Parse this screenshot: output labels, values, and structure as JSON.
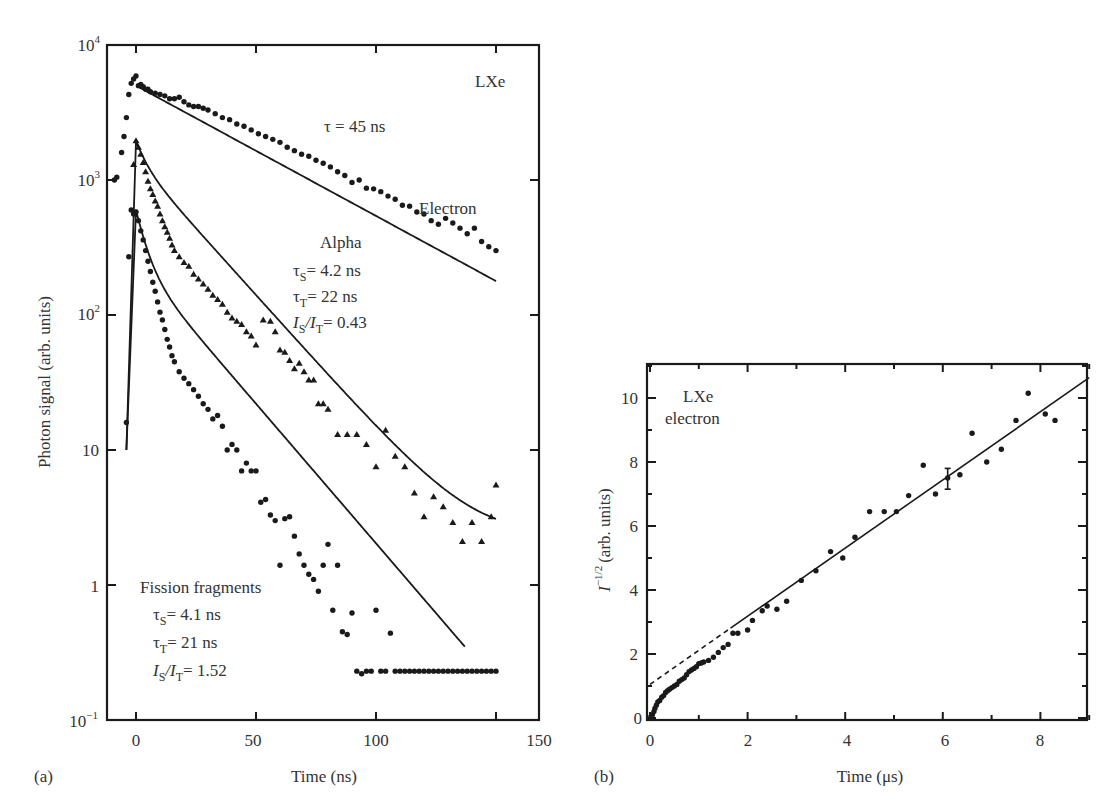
{
  "chart_data": [
    {
      "panel": "(a)",
      "type": "scatter",
      "title": "",
      "xlabel": "Time (ns)",
      "ylabel": "Photon signal (arb. units)",
      "yscale": "log",
      "xlim": [
        -12,
        168
      ],
      "ylim": [
        0.1,
        10000
      ],
      "x_ticks": [
        0,
        50,
        100,
        150
      ],
      "x_tick_labels": [
        "0",
        "50",
        "100",
        "150"
      ],
      "y_ticks": [
        0.1,
        1,
        10,
        100,
        1000,
        10000
      ],
      "y_tick_labels": [
        "10^-1",
        "1",
        "10",
        "10^2",
        "10^3",
        "10^4"
      ],
      "grid": false,
      "annotations": {
        "material": "LXe",
        "electron": {
          "label": "Electron",
          "tau": "τ = 45 ns"
        },
        "alpha": {
          "label": "Alpha",
          "tau_s": "4.2 ns",
          "tau_t": "22 ns",
          "ratio": "0.43"
        },
        "fission": {
          "label": "Fission fragments",
          "tau_s": "4.1 ns",
          "tau_t": "21 ns",
          "ratio": "1.52"
        }
      },
      "series": [
        {
          "name": "Electron",
          "marker": "circle",
          "fit": {
            "type": "exponential",
            "tau_ns": 45,
            "A0": 5000,
            "t_start": 0,
            "t_end": 150
          },
          "x": [
            -9,
            -8,
            -6,
            -5,
            -4,
            -3,
            -2,
            -1,
            0,
            1,
            2,
            3,
            4,
            5,
            6,
            8,
            10,
            12,
            14,
            16,
            18,
            20,
            22,
            24,
            26,
            28,
            30,
            33,
            36,
            39,
            42,
            45,
            48,
            51,
            54,
            57,
            60,
            63,
            66,
            69,
            72,
            75,
            78,
            81,
            84,
            87,
            90,
            93,
            96,
            99,
            102,
            105,
            108,
            111,
            114,
            117,
            120,
            123,
            126,
            129,
            132,
            135,
            138,
            141,
            144,
            147,
            150
          ],
          "y": [
            1000,
            1050,
            1600,
            2100,
            2900,
            4300,
            5200,
            5600,
            5900,
            5000,
            5100,
            4900,
            4700,
            4700,
            4500,
            4400,
            4300,
            4200,
            4000,
            4000,
            4100,
            3800,
            3600,
            3500,
            3500,
            3400,
            3300,
            3100,
            2900,
            2800,
            2600,
            2500,
            2350,
            2200,
            2100,
            2000,
            1900,
            1750,
            1650,
            1550,
            1500,
            1400,
            1330,
            1250,
            1150,
            1080,
            960,
            1000,
            870,
            860,
            820,
            760,
            720,
            650,
            640,
            580,
            560,
            500,
            470,
            520,
            480,
            440,
            400,
            440,
            350,
            320,
            300,
            330,
            290,
            300,
            230,
            250,
            180
          ]
        },
        {
          "name": "Alpha",
          "marker": "triangle",
          "fit": {
            "type": "two-exponential",
            "tau_s_ns": 4.2,
            "tau_t_ns": 22,
            "ratio": 0.43,
            "peak": 1950,
            "t_end": 150
          },
          "x": [
            -1,
            0,
            1,
            2,
            3,
            4,
            5,
            6,
            7,
            8,
            9,
            10,
            11,
            12,
            13,
            14,
            15,
            16,
            18,
            20,
            22,
            24,
            26,
            28,
            30,
            32,
            34,
            36,
            38,
            40,
            42,
            44,
            46,
            48,
            50,
            53,
            56,
            58,
            60,
            62,
            64,
            66,
            68,
            70,
            72,
            74,
            76,
            78,
            80,
            84,
            88,
            92,
            96,
            100,
            104,
            108,
            112,
            116,
            120,
            124,
            128,
            132,
            136,
            140,
            144,
            148,
            150
          ],
          "y": [
            1300,
            1950,
            1750,
            1550,
            1350,
            1150,
            980,
            860,
            780,
            700,
            640,
            560,
            500,
            450,
            410,
            370,
            330,
            300,
            270,
            245,
            230,
            200,
            185,
            170,
            155,
            140,
            130,
            120,
            105,
            95,
            90,
            85,
            75,
            70,
            60,
            92,
            90,
            75,
            55,
            53,
            46,
            40,
            44,
            38,
            33,
            33,
            22,
            22,
            20,
            13,
            13,
            13,
            11,
            7.5,
            14,
            9,
            7.5,
            4.8,
            3.2,
            4.5,
            3.8,
            2.9,
            2.1,
            2.9,
            2.1,
            3.2,
            5.5
          ]
        },
        {
          "name": "Fission fragments",
          "marker": "circle",
          "fit": {
            "type": "two-exponential",
            "tau_s_ns": 4.1,
            "tau_t_ns": 21,
            "ratio": 1.52,
            "peak": 600,
            "t_end": 137
          },
          "x": [
            -4,
            -3,
            -2,
            -1,
            0,
            1,
            2,
            3,
            4,
            5,
            6,
            7,
            8,
            9,
            10,
            11,
            12,
            13,
            14,
            15,
            16,
            18,
            20,
            22,
            24,
            26,
            28,
            30,
            32,
            34,
            36,
            38,
            40,
            42,
            44,
            46,
            48,
            50,
            52,
            54,
            56,
            58,
            60,
            62,
            64,
            66,
            68,
            70,
            72,
            74,
            76,
            78,
            80,
            82,
            84,
            86,
            88,
            90,
            92,
            94,
            96,
            98,
            100,
            102,
            104,
            106,
            108,
            110,
            112,
            114,
            116,
            118,
            120,
            122,
            124,
            126,
            128,
            130,
            132,
            134,
            136,
            138,
            140,
            142,
            144,
            146,
            148,
            150
          ],
          "y": [
            16,
            270,
            600,
            560,
            580,
            500,
            420,
            360,
            300,
            250,
            210,
            175,
            150,
            125,
            105,
            92,
            78,
            66,
            58,
            50,
            45,
            38,
            34,
            31,
            28,
            25,
            22,
            20,
            17,
            18,
            15,
            10,
            11,
            10,
            7,
            8,
            7,
            7,
            4.1,
            4.3,
            3.3,
            3.0,
            1.4,
            3.1,
            3.2,
            2.3,
            1.7,
            1.4,
            1.2,
            1.1,
            0.9,
            1.4,
            2.0,
            0.65,
            1.4,
            0.45,
            0.43,
            0.62,
            0.23,
            0.22,
            0.23,
            0.23,
            0.65,
            0.23,
            0.23,
            0.44,
            0.23,
            0.23,
            0.23,
            0.23,
            0.23,
            0.23,
            0.23,
            0.23,
            0.23,
            0.23,
            0.23,
            0.23,
            0.23,
            0.23,
            0.23,
            0.23,
            0.23,
            0.23,
            0.23,
            0.23,
            0.23,
            0.23
          ]
        }
      ]
    },
    {
      "panel": "(b)",
      "type": "scatter",
      "title": "",
      "xlabel": "Time (µs)",
      "ylabel": "I^-1/2 (arb. units)",
      "xlim": [
        0,
        9
      ],
      "ylim": [
        0,
        11.1
      ],
      "x_ticks": [
        0,
        2,
        4,
        6,
        8
      ],
      "x_tick_labels": [
        "0",
        "2",
        "4",
        "6",
        "8"
      ],
      "y_ticks": [
        0,
        2,
        4,
        6,
        8,
        10
      ],
      "y_tick_labels": [
        "0",
        "2",
        "4",
        "6",
        "8",
        "10"
      ],
      "grid": false,
      "annotations": {
        "material": "LXe",
        "particle": "electron"
      },
      "series": [
        {
          "name": "LXe electron data",
          "marker": "circle",
          "x": [
            0.02,
            0.05,
            0.08,
            0.1,
            0.13,
            0.16,
            0.2,
            0.24,
            0.28,
            0.32,
            0.36,
            0.4,
            0.45,
            0.5,
            0.55,
            0.6,
            0.65,
            0.7,
            0.75,
            0.8,
            0.85,
            0.9,
            0.95,
            1.0,
            1.05,
            1.1,
            1.2,
            1.3,
            1.4,
            1.5,
            1.6,
            1.7,
            1.8,
            2.0,
            2.1,
            2.3,
            2.4,
            2.6,
            2.8,
            3.1,
            3.4,
            3.7,
            3.95,
            4.2,
            4.5,
            4.8,
            5.05,
            5.3,
            5.6,
            5.85,
            6.1,
            6.35,
            6.6,
            6.9,
            7.2,
            7.5,
            7.75,
            8.1,
            8.3
          ],
          "y": [
            0.05,
            0.1,
            0.2,
            0.3,
            0.4,
            0.5,
            0.55,
            0.65,
            0.7,
            0.8,
            0.85,
            0.9,
            0.95,
            1.0,
            1.05,
            1.15,
            1.2,
            1.25,
            1.35,
            1.45,
            1.5,
            1.55,
            1.6,
            1.7,
            1.72,
            1.75,
            1.8,
            1.9,
            2.05,
            2.2,
            2.3,
            2.65,
            2.65,
            2.75,
            3.05,
            3.35,
            3.5,
            3.4,
            3.65,
            4.3,
            4.6,
            5.2,
            5.0,
            5.65,
            6.45,
            6.45,
            6.45,
            6.95,
            7.9,
            7.0,
            7.5,
            7.6,
            8.9,
            8.0,
            8.4,
            9.3,
            10.15,
            9.5,
            9.3
          ]
        }
      ],
      "fit": {
        "type": "linear",
        "intercept": 1.05,
        "slope": 1.065,
        "dashed_range": [
          0,
          1.65
        ],
        "solid_range": [
          1.65,
          9.0
        ]
      },
      "error_bar": {
        "x": 6.1,
        "y": 7.5,
        "low": 7.15,
        "high": 7.8
      }
    }
  ],
  "panel_a": {
    "label": "(a)",
    "xlabel": "Time (ns)",
    "ylabel": "Photon signal (arb. units)",
    "material": "LXe",
    "tau": "τ = 45 ns",
    "electron": "Electron",
    "alpha": "Alpha",
    "alpha_ts": "= 4.2 ns",
    "alpha_tt": "= 22 ns",
    "alpha_ratio": "= 0.43",
    "fission": "Fission fragments",
    "fission_ts": "= 4.1 ns",
    "fission_tt": "= 21 ns",
    "fission_ratio": "= 1.52",
    "xticks": [
      "0",
      "50",
      "100",
      "150"
    ],
    "yticks": [
      "10",
      "1",
      "10",
      "10",
      "10",
      "10"
    ],
    "yexp": [
      "−1",
      "",
      "",
      "2",
      "3",
      "4"
    ]
  },
  "panel_b": {
    "label": "(b)",
    "xlabel": "Time (μs)",
    "ylabel": "(arb. units)",
    "ylabel_sym": "I",
    "ylabel_exp": "−1/2",
    "material": "LXe",
    "particle": "electron",
    "xticks": [
      "0",
      "2",
      "4",
      "6",
      "8"
    ],
    "yticks": [
      "0",
      "2",
      "4",
      "6",
      "8",
      "10"
    ]
  }
}
